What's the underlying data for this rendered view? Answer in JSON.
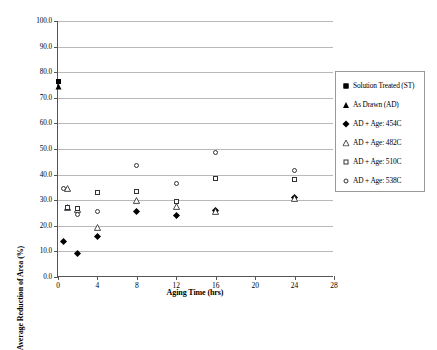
{
  "chart_data": {
    "type": "scatter",
    "title": "",
    "xlabel": "Aging Time (hrs)",
    "ylabel": "Average Reduction of Area (%)",
    "xlim": [
      0,
      28
    ],
    "ylim": [
      0,
      100
    ],
    "xticks": [
      0,
      4,
      8,
      12,
      16,
      20,
      24,
      28
    ],
    "xtick_labels": [
      "0",
      "4",
      "8",
      "12",
      "16",
      "20",
      "24",
      "28"
    ],
    "yticks": [
      0,
      10,
      20,
      30,
      40,
      50,
      60,
      70,
      80,
      90,
      100
    ],
    "ytick_labels": [
      "0.0",
      "10.0",
      "20.0",
      "30.0",
      "40.0",
      "50.0",
      "60.0",
      "70.0",
      "80.0",
      "90.0",
      "100.0"
    ],
    "grid": "horizontal",
    "legend_position": "right",
    "series": [
      {
        "name": "Solution Treated (ST)",
        "marker": "square-filled",
        "points": [
          {
            "x": 0,
            "y": 76.5
          }
        ]
      },
      {
        "name": "As Drawn (AD)",
        "marker": "triangle-filled",
        "points": [
          {
            "x": 0,
            "y": 74.5
          }
        ]
      },
      {
        "name": "AD + Age: 454C",
        "marker": "diamond-filled",
        "points": [
          {
            "x": 0.6,
            "y": 14.0
          },
          {
            "x": 2.0,
            "y": 9.2
          },
          {
            "x": 4.0,
            "y": 15.8
          },
          {
            "x": 8.0,
            "y": 25.5
          },
          {
            "x": 12.0,
            "y": 23.9
          },
          {
            "x": 16.0,
            "y": 26.0
          },
          {
            "x": 24.0,
            "y": 31.0
          }
        ]
      },
      {
        "name": "AD + Age: 482C",
        "marker": "triangle-open",
        "points": [
          {
            "x": 1.0,
            "y": 34.5
          },
          {
            "x": 1.0,
            "y": 27.0
          },
          {
            "x": 2.0,
            "y": 26.5
          },
          {
            "x": 4.0,
            "y": 19.5
          },
          {
            "x": 8.0,
            "y": 30.0
          },
          {
            "x": 12.0,
            "y": 27.5
          },
          {
            "x": 16.0,
            "y": 25.5
          },
          {
            "x": 24.0,
            "y": 30.5
          }
        ]
      },
      {
        "name": "AD + Age: 510C",
        "marker": "square-open",
        "points": [
          {
            "x": 1.0,
            "y": 27.2
          },
          {
            "x": 2.0,
            "y": 26.8
          },
          {
            "x": 4.0,
            "y": 33.0
          },
          {
            "x": 8.0,
            "y": 33.5
          },
          {
            "x": 12.0,
            "y": 29.5
          },
          {
            "x": 16.0,
            "y": 38.5
          },
          {
            "x": 24.0,
            "y": 38.0
          }
        ]
      },
      {
        "name": "AD + Age: 538C",
        "marker": "circle-open",
        "points": [
          {
            "x": 0.6,
            "y": 34.5
          },
          {
            "x": 2.0,
            "y": 24.5
          },
          {
            "x": 4.0,
            "y": 25.5
          },
          {
            "x": 8.0,
            "y": 43.5
          },
          {
            "x": 12.0,
            "y": 36.5
          },
          {
            "x": 16.0,
            "y": 48.5
          },
          {
            "x": 24.0,
            "y": 41.5
          }
        ]
      }
    ]
  },
  "legend": {
    "items": [
      {
        "label": "Solution Treated (ST)",
        "marker": "square-filled"
      },
      {
        "label": "As Drawn (AD)",
        "marker": "triangle-filled"
      },
      {
        "label": "AD + Age: 454C",
        "marker": "diamond-filled"
      },
      {
        "label": "AD + Age: 482C",
        "marker": "triangle-open"
      },
      {
        "label": "AD + Age: 510C",
        "marker": "square-open"
      },
      {
        "label": "AD + Age: 538C",
        "marker": "circle-open"
      }
    ]
  }
}
